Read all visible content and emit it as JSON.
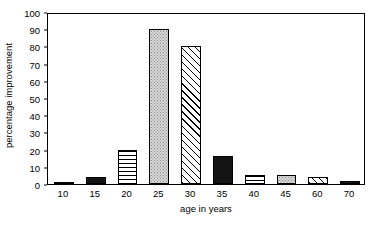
{
  "chart_data": {
    "type": "bar",
    "title": "",
    "subtitle": "",
    "xlabel": "age in years",
    "ylabel": "percentage improvement",
    "categories": [
      "10",
      "15",
      "20",
      "25",
      "30",
      "35",
      "40",
      "45",
      "60",
      "70"
    ],
    "values": [
      1,
      4,
      20,
      90,
      80,
      16,
      5,
      5,
      4,
      2
    ],
    "series": [
      {
        "name": "percentage improvement",
        "values": [
          1,
          4,
          20,
          90,
          80,
          16,
          5,
          5,
          4,
          2
        ]
      }
    ],
    "bar_fills": [
      "dots",
      "solid",
      "hlines",
      "dots",
      "diag",
      "solid",
      "hlines",
      "dots",
      "diag",
      "solid"
    ],
    "ylim": [
      0,
      100
    ],
    "yticks": [
      0,
      10,
      20,
      30,
      40,
      50,
      60,
      70,
      80,
      90,
      100
    ],
    "ytick_labels": [
      "0",
      "10",
      "20",
      "30",
      "40",
      "50",
      "60",
      "70",
      "80",
      "90",
      "100"
    ],
    "xtick_labels": [
      "10",
      "15",
      "20",
      "25",
      "30",
      "35",
      "40",
      "45",
      "60",
      "70"
    ],
    "grid": false,
    "legend": "none",
    "frame": "box",
    "annotations": []
  }
}
